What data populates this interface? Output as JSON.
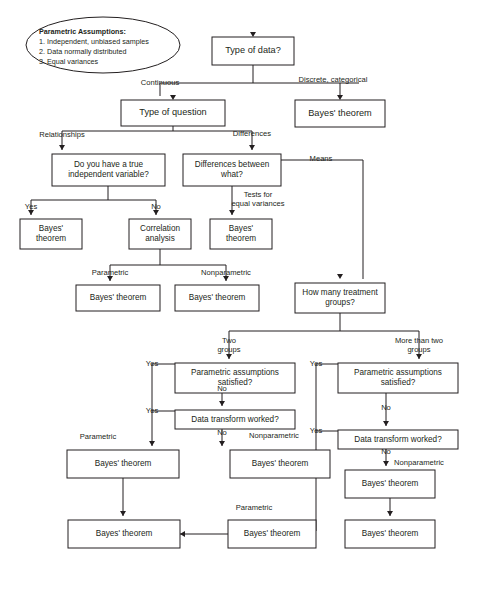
{
  "diagram": {
    "colors": {
      "background": "#ffffff",
      "stroke": "#231f20",
      "box_fill": "#ffffff",
      "text": "#231f20"
    },
    "assumptions_note": {
      "heading": "Parametric Assumptions:",
      "lines": [
        "1. Independent, unbiased samples",
        "2. Data normally distributed",
        "3. Equal variances"
      ]
    },
    "nodes": [
      {
        "id": "type_of_data",
        "label": "Type of data?",
        "x": 212,
        "y": 37,
        "w": 82,
        "h": 28,
        "size": "big"
      },
      {
        "id": "bayes_discrete",
        "label": "Bayes' theorem",
        "x": 295,
        "y": 100,
        "w": 90,
        "h": 27,
        "size": "big"
      },
      {
        "id": "type_of_question",
        "label": "Type of question",
        "x": 121,
        "y": 100,
        "w": 104,
        "h": 26,
        "size": "big"
      },
      {
        "id": "true_independent_var",
        "label": "Do you have a true\nindependent variable?",
        "x": 52,
        "y": 154,
        "w": 113,
        "h": 32,
        "size": "small"
      },
      {
        "id": "differences_between",
        "label": "Differences between\nwhat?",
        "x": 183,
        "y": 154,
        "w": 98,
        "h": 32,
        "size": "small"
      },
      {
        "id": "bayes_yes_indep",
        "label": "Bayes'\ntheorem",
        "x": 20,
        "y": 219,
        "w": 62,
        "h": 30,
        "size": "small"
      },
      {
        "id": "correlation_analysis",
        "label": "Correlation\nanalysis",
        "x": 129,
        "y": 219,
        "w": 62,
        "h": 30,
        "size": "small"
      },
      {
        "id": "bayes_equal_var",
        "label": "Bayes'\ntheorem",
        "x": 210,
        "y": 219,
        "w": 62,
        "h": 30,
        "size": "small"
      },
      {
        "id": "bayes_corr_parametric",
        "label": "Bayes' theorem",
        "x": 76,
        "y": 285,
        "w": 84,
        "h": 26,
        "size": "small"
      },
      {
        "id": "bayes_corr_nonparam",
        "label": "Bayes' theorem",
        "x": 175,
        "y": 285,
        "w": 84,
        "h": 26,
        "size": "small"
      },
      {
        "id": "how_many_groups",
        "label": "How many treatment\ngroups?",
        "x": 295,
        "y": 283,
        "w": 90,
        "h": 30,
        "size": "small"
      },
      {
        "id": "param_assum_two",
        "label": "Parametric assumptions\nsatisfied?",
        "x": 175,
        "y": 363,
        "w": 120,
        "h": 30,
        "size": "small"
      },
      {
        "id": "param_assum_more",
        "label": "Parametric assumptions\nsatisfied?",
        "x": 338,
        "y": 363,
        "w": 120,
        "h": 30,
        "size": "small"
      },
      {
        "id": "data_transform_two",
        "label": "Data transform worked?",
        "x": 175,
        "y": 410,
        "w": 120,
        "h": 19,
        "size": "small"
      },
      {
        "id": "data_transform_more",
        "label": "Data transform worked?",
        "x": 338,
        "y": 430,
        "w": 120,
        "h": 19,
        "size": "small"
      },
      {
        "id": "bayes_two_parametric",
        "label": "Bayes' theorem",
        "x": 67,
        "y": 450,
        "w": 112,
        "h": 28,
        "size": "small"
      },
      {
        "id": "bayes_two_nonparam",
        "label": "Bayes' theorem",
        "x": 230,
        "y": 450,
        "w": 100,
        "h": 28,
        "size": "small"
      },
      {
        "id": "bayes_more_nonparam",
        "label": "Bayes' theorem",
        "x": 345,
        "y": 470,
        "w": 90,
        "h": 28,
        "size": "small"
      },
      {
        "id": "bayes_final_left",
        "label": "Bayes' theorem",
        "x": 68,
        "y": 520,
        "w": 112,
        "h": 28,
        "size": "small"
      },
      {
        "id": "bayes_final_parametric",
        "label": "Bayes' theorem",
        "x": 228,
        "y": 520,
        "w": 88,
        "h": 28,
        "size": "small"
      },
      {
        "id": "bayes_final_posthoc",
        "label": "Bayes' theorem",
        "x": 345,
        "y": 520,
        "w": 90,
        "h": 28,
        "size": "small"
      }
    ],
    "edge_labels": [
      {
        "id": "continuous",
        "text": "Continuous",
        "x": 160,
        "y": 83,
        "anchor": "middle"
      },
      {
        "id": "discrete",
        "text": "Discrete, categorical",
        "x": 333,
        "y": 80,
        "anchor": "middle"
      },
      {
        "id": "relationships",
        "text": "Relationships",
        "x": 62,
        "y": 135,
        "anchor": "middle"
      },
      {
        "id": "differences",
        "text": "Differences",
        "x": 252,
        "y": 134,
        "anchor": "middle"
      },
      {
        "id": "means",
        "text": "Means",
        "x": 321,
        "y": 159,
        "anchor": "middle"
      },
      {
        "id": "yes_indep",
        "text": "Yes",
        "x": 31,
        "y": 207,
        "anchor": "middle"
      },
      {
        "id": "no_indep",
        "text": "No",
        "x": 156,
        "y": 207,
        "anchor": "middle"
      },
      {
        "id": "tests_equal_var",
        "text": "Tests for\nequal variances",
        "x": 258,
        "y": 195,
        "anchor": "middle"
      },
      {
        "id": "parametric_corr",
        "text": "Parametric",
        "x": 110,
        "y": 273,
        "anchor": "middle"
      },
      {
        "id": "nonparametric_corr",
        "text": "Nonparametric",
        "x": 226,
        "y": 273,
        "anchor": "middle"
      },
      {
        "id": "two_groups",
        "text": "Two\ngroups",
        "x": 229,
        "y": 341,
        "anchor": "middle"
      },
      {
        "id": "more_than_two",
        "text": "More than two\ngroups",
        "x": 419,
        "y": 341,
        "anchor": "middle"
      },
      {
        "id": "yes_two_param",
        "text": "Yes",
        "x": 152,
        "y": 364,
        "anchor": "middle"
      },
      {
        "id": "yes_two_trans",
        "text": "Yes",
        "x": 152,
        "y": 411,
        "anchor": "middle"
      },
      {
        "id": "no_two_param",
        "text": "No",
        "x": 222,
        "y": 389,
        "anchor": "middle"
      },
      {
        "id": "no_two_trans",
        "text": "No",
        "x": 222,
        "y": 433,
        "anchor": "middle"
      },
      {
        "id": "parametric_two",
        "text": "Parametric",
        "x": 98,
        "y": 437,
        "anchor": "middle"
      },
      {
        "id": "nonparametric_two",
        "text": "Nonparametric",
        "x": 274,
        "y": 436,
        "anchor": "middle"
      },
      {
        "id": "yes_more_param",
        "text": "Yes",
        "x": 316,
        "y": 364,
        "anchor": "middle"
      },
      {
        "id": "yes_more_trans",
        "text": "Yes",
        "x": 316,
        "y": 431,
        "anchor": "middle"
      },
      {
        "id": "no_more_param",
        "text": "No",
        "x": 386,
        "y": 408,
        "anchor": "middle"
      },
      {
        "id": "no_more_trans",
        "text": "No",
        "x": 386,
        "y": 452,
        "anchor": "middle"
      },
      {
        "id": "nonparametric_more",
        "text": "Nonparametric",
        "x": 419,
        "y": 463,
        "anchor": "middle"
      },
      {
        "id": "parametric_final",
        "text": "Parametric",
        "x": 254,
        "y": 508,
        "anchor": "middle"
      }
    ],
    "connectors": [
      "M253,65 L253,83",
      "M160,83 L359,83",
      "M160,83 L160,96",
      "M340,83 L340,96",
      "M173,100 L173,131",
      "M62,131 L252,131",
      "M62,131 L62,150",
      "M252,131 L252,150",
      "M108,186 L108,200",
      "M31,200 L156,200",
      "M31,200 L31,215",
      "M156,200 L156,215",
      "M232,186 L232,215",
      "M160,249 L160,265",
      "M110,265 L226,265",
      "M110,265 L110,281",
      "M226,265 L226,281",
      "M281,160 L363,160",
      "M363,160 L363,279",
      "M340,313 L340,331",
      "M229,331 L419,331",
      "M229,331 L229,359",
      "M419,331 L419,359",
      "M222,393 L222,406",
      "M222,429 L222,446",
      "M175,364 L152,364",
      "M152,364 L152,446",
      "M175,411 L152,411",
      "M386,393 L386,426",
      "M386,449 L386,466",
      "M338,364 L316,364",
      "M316,364 L316,531",
      "M338,431 L316,431",
      "M316,531 L272,531",
      "M123,478 L123,516",
      "M390,498 L390,516",
      "M228,534 L180,534"
    ]
  }
}
